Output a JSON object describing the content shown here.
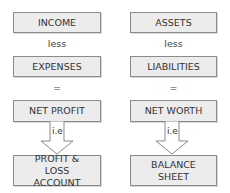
{
  "left": {
    "top": "INCOME",
    "operator1": "less",
    "middle": "EXPENSES",
    "operator2": "=",
    "result": "NET PROFIT",
    "arrow_label": "i.e",
    "statement": "PROFIT & LOSS ACCOUNT"
  },
  "right": {
    "top": "ASSETS",
    "operator1": "less",
    "middle": "LIABILITIES",
    "operator2": "=",
    "result": "NET WORTH",
    "arrow_label": "i.e",
    "statement": "BALANCE SHEET"
  }
}
